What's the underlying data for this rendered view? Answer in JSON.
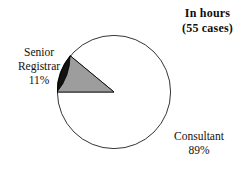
{
  "title": {
    "line1": "In hours",
    "line2": "(55 cases)"
  },
  "chart_data": {
    "type": "pie",
    "title": "In hours (55 cases)",
    "subtitle": "(55 cases)",
    "total_cases": 55,
    "xlabel": "",
    "ylabel": "",
    "legend_position": "none",
    "grid": false,
    "categories": [
      "Consultant",
      "Senior Registrar"
    ],
    "values": [
      89,
      11
    ],
    "value_unit": "%",
    "slices": [
      {
        "label": "Consultant",
        "value": 89,
        "value_label": "89%",
        "color": "#121212",
        "start_angle_deg": 220,
        "end_angle_deg": 580
      },
      {
        "label": "Senior Registrar",
        "value": 11,
        "value_label": "11%",
        "color": "#9d9d9d",
        "start_angle_deg": 180,
        "end_angle_deg": 220
      }
    ],
    "annotations": [
      {
        "name": "senior-registrar-label",
        "lines": [
          "Senior",
          "Registrar",
          "11%"
        ]
      },
      {
        "name": "consultant-label",
        "lines": [
          "Consultant",
          "89%"
        ]
      }
    ]
  },
  "labels": {
    "senior_registrar": {
      "line1": "Senior",
      "line2": "Registrar",
      "line3": "11%"
    },
    "consultant": {
      "line1": "Consultant",
      "line2": "89%"
    }
  },
  "colors": {
    "background": "#ffffff",
    "consultant_slice": "#121212",
    "senior_registrar_slice": "#9d9d9d",
    "slice_outline": "#000000",
    "text": "#111111"
  }
}
